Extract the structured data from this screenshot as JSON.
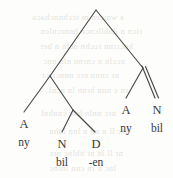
{
  "figure": {
    "kind": "syntax-tree",
    "ink_color": "#3a3a38",
    "background_color": "#fdfdfb",
    "ghost_color": "#cfcdc8"
  },
  "tree": {
    "root": {
      "label": "",
      "x": 96,
      "y": 9
    },
    "nodes": [
      {
        "id": "root",
        "label": "",
        "x": 96,
        "y": 9
      },
      {
        "id": "left",
        "label": "",
        "x": 50,
        "y": 76
      },
      {
        "id": "nd",
        "label": "",
        "x": 72,
        "y": 110
      },
      {
        "id": "right",
        "label": "",
        "x": 143,
        "y": 68
      }
    ],
    "branches": [
      {
        "from": "root",
        "to": "left",
        "style": "single"
      },
      {
        "from": "root",
        "to": "right",
        "style": "single"
      },
      {
        "from": "left",
        "to": "leaf-a1",
        "style": "single"
      },
      {
        "from": "left",
        "to": "nd",
        "style": "single"
      },
      {
        "from": "nd",
        "to": "leaf-n1",
        "style": "single"
      },
      {
        "from": "nd",
        "to": "leaf-d1",
        "style": "single"
      },
      {
        "from": "right",
        "to": "leaf-a2",
        "style": "single"
      },
      {
        "from": "right",
        "to": "leaf-n2",
        "style": "double"
      }
    ],
    "leaves": [
      {
        "id": "leaf-a1",
        "category": "A",
        "form": "ny",
        "x": 24,
        "cat_y": 118,
        "form_y": 135
      },
      {
        "id": "leaf-n1",
        "category": "N",
        "form": "bil",
        "x": 62,
        "cat_y": 138,
        "form_y": 156
      },
      {
        "id": "leaf-d1",
        "category": "D",
        "form": "-en",
        "x": 96,
        "cat_y": 138,
        "form_y": 156
      },
      {
        "id": "leaf-a2",
        "category": "A",
        "form": "ny",
        "x": 126,
        "cat_y": 104,
        "form_y": 121
      },
      {
        "id": "leaf-n2",
        "category": "N",
        "form": "bil",
        "x": 157,
        "cat_y": 104,
        "form_y": 121
      }
    ]
  },
  "ghost_text": {
    "note": "faint mirrored show-through text from the opposite page side, illegible",
    "lines": [
      {
        "text": "a  wmcen  m  tcchnnchaco",
        "x": 4,
        "y": 12,
        "width": 120
      },
      {
        "text": "ricn  n  dnhllcncn  hnnrcnlcn",
        "x": 2,
        "y": 26,
        "width": 140
      },
      {
        "text": "hncrrnn  rcchn  ncln  n  her",
        "x": 3,
        "y": 41,
        "width": 130
      },
      {
        "text": "nccln  n  cnrnn  nln  nnc",
        "x": 5,
        "y": 56,
        "width": 120
      },
      {
        "text": "nr  cnnn  nrc  nnncrrcr",
        "x": 4,
        "y": 70,
        "width": 115
      },
      {
        "text": "rn  c  nnn  hrnn  ln  ncnl",
        "x": 3,
        "y": 85,
        "width": 125
      },
      {
        "text": "nrc  nnln  hnc  cnnhnl",
        "x": 6,
        "y": 108,
        "width": 110
      },
      {
        "text": "hrc  ll  n  nn  n  lnn  lnhn",
        "x": 4,
        "y": 126,
        "width": 125
      },
      {
        "text": "nr  ll  ln  nr  nhlnc  nrc",
        "x": 8,
        "y": 148,
        "width": 115
      },
      {
        "text": "lnc  n  rn  cnn  lnrnc",
        "x": 6,
        "y": 163,
        "width": 110
      }
    ]
  }
}
